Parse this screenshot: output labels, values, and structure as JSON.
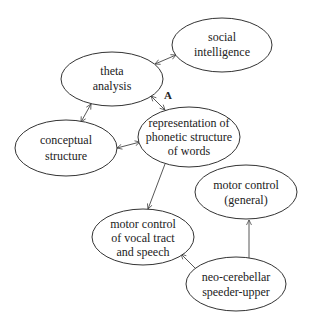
{
  "diagram": {
    "nodes": [
      {
        "id": "social",
        "lines": [
          "social",
          "intelligence"
        ]
      },
      {
        "id": "theta",
        "lines": [
          "theta",
          "analysis"
        ]
      },
      {
        "id": "conceptual",
        "lines": [
          "conceptual",
          "structure"
        ]
      },
      {
        "id": "representation",
        "lines": [
          "representation of",
          "phonetic structure",
          "of words"
        ]
      },
      {
        "id": "motor_general",
        "lines": [
          "motor control",
          "(general)"
        ]
      },
      {
        "id": "motor_vocal",
        "lines": [
          "motor control",
          "of vocal tract",
          "and speech"
        ]
      },
      {
        "id": "neo",
        "lines": [
          "neo-cerebellar",
          "speeder-upper"
        ]
      }
    ],
    "edge_label": "A",
    "edges": [
      {
        "from": "theta",
        "to": "social",
        "type": "bidirectional"
      },
      {
        "from": "theta",
        "to": "conceptual",
        "type": "bidirectional"
      },
      {
        "from": "theta",
        "to": "representation",
        "type": "bidirectional",
        "label": "A"
      },
      {
        "from": "conceptual",
        "to": "representation",
        "type": "bidirectional"
      },
      {
        "from": "representation",
        "to": "motor_vocal",
        "type": "directed"
      },
      {
        "from": "neo",
        "to": "motor_vocal",
        "type": "directed"
      },
      {
        "from": "neo",
        "to": "motor_general",
        "type": "directed"
      }
    ]
  }
}
